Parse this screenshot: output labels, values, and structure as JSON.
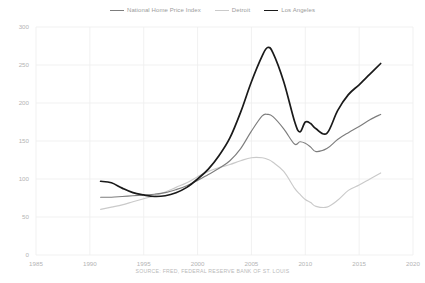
{
  "chart_data": {
    "type": "line",
    "title": "",
    "subtitle": "",
    "xlabel": "",
    "ylabel": "",
    "xlim": [
      1985,
      2020
    ],
    "ylim": [
      0,
      300
    ],
    "xticks": [
      "1985",
      "1990",
      "1995",
      "2000",
      "2005",
      "2010",
      "2015",
      "2020"
    ],
    "yticks": [
      "0",
      "50",
      "100",
      "150",
      "200",
      "250",
      "300"
    ],
    "grid": true,
    "legend_position": "top-center",
    "annotation": "SOURCE: FRED, FEDERAL RESERVE BANK OF ST. LOUIS",
    "x": [
      1991,
      1992,
      1993,
      1994,
      1995,
      1996,
      1997,
      1998,
      1999,
      2000,
      2001,
      2002,
      2003,
      2004,
      2005,
      2006,
      2006.5,
      2007,
      2008,
      2009,
      2009.5,
      2010,
      2010.5,
      2011,
      2012,
      2013,
      2014,
      2015,
      2016,
      2017
    ],
    "series": [
      {
        "name": "National Home Price Index",
        "color": "#7d7d7d",
        "values": [
          76,
          76,
          77,
          78,
          79,
          80,
          82,
          86,
          91,
          98,
          106,
          114,
          124,
          140,
          163,
          183,
          185,
          182,
          166,
          146,
          149,
          147,
          142,
          136,
          140,
          152,
          161,
          169,
          178,
          185
        ]
      },
      {
        "name": "Detroit",
        "color": "#cacaca",
        "values": [
          60,
          63,
          66,
          70,
          74,
          78,
          83,
          89,
          95,
          103,
          110,
          115,
          119,
          124,
          128,
          128,
          126,
          122,
          110,
          88,
          80,
          73,
          69,
          64,
          63,
          72,
          85,
          92,
          100,
          108
        ]
      },
      {
        "name": "Los Angeles",
        "color": "#1a1a1a",
        "values": [
          97,
          95,
          88,
          82,
          79,
          77,
          78,
          82,
          89,
          100,
          113,
          131,
          154,
          188,
          228,
          262,
          273,
          266,
          228,
          176,
          162,
          175,
          173,
          166,
          160,
          190,
          211,
          224,
          238,
          252
        ]
      }
    ]
  },
  "axes": {
    "xticks": [
      {
        "label": "1985",
        "value": 1985
      },
      {
        "label": "1990",
        "value": 1990
      },
      {
        "label": "1995",
        "value": 1995
      },
      {
        "label": "2000",
        "value": 2000
      },
      {
        "label": "2005",
        "value": 2005
      },
      {
        "label": "2010",
        "value": 2010
      },
      {
        "label": "2015",
        "value": 2015
      },
      {
        "label": "2020",
        "value": 2020
      }
    ],
    "yticks": [
      {
        "label": "300",
        "value": 300
      },
      {
        "label": "250",
        "value": 250
      },
      {
        "label": "200",
        "value": 200
      },
      {
        "label": "150",
        "value": 150
      },
      {
        "label": "100",
        "value": 100
      },
      {
        "label": "50",
        "value": 50
      },
      {
        "label": "0",
        "value": 0
      }
    ]
  },
  "legend": {
    "items": [
      {
        "label": "National Home Price Index",
        "color": "#7d7d7d",
        "width": "1.1px"
      },
      {
        "label": "Detroit",
        "color": "#cacaca",
        "width": "1.1px"
      },
      {
        "label": "Los Angeles",
        "color": "#1a1a1a",
        "width": "1.6px"
      }
    ]
  },
  "footer": {
    "source": "SOURCE: FRED, FEDERAL RESERVE BANK OF ST. LOUIS"
  },
  "colors": {
    "background": "#ffffff",
    "grid": "#ededed",
    "tick_text": "#b4b4b4",
    "legend_text": "#9b9b9b",
    "source_text": "#b9b9b9"
  }
}
